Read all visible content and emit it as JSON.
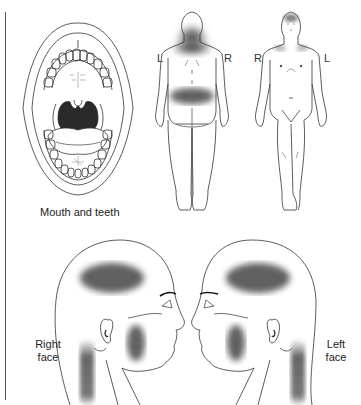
{
  "figure": {
    "panels": [
      {
        "id": "mouth",
        "label": "Mouth and teeth"
      },
      {
        "id": "body-back",
        "left_marker": "L",
        "right_marker": "R"
      },
      {
        "id": "body-front",
        "left_marker": "R",
        "right_marker": "L"
      },
      {
        "id": "right-face",
        "label_line1": "Right",
        "label_line2": "face"
      },
      {
        "id": "left-face",
        "label_line1": "Left",
        "label_line2": "face"
      }
    ],
    "pain_zones": {
      "body_back": [
        "upper back / neck base",
        "lower back band"
      ],
      "body_front": [
        "forehead",
        "shoulders"
      ],
      "faces": [
        "temporal region",
        "cheek / masseter",
        "posterior neck"
      ]
    },
    "colors": {
      "line": "#333333",
      "shade": "#4a4a4a",
      "mouth_dark": "#2a2a2a",
      "background": "#ffffff"
    }
  }
}
